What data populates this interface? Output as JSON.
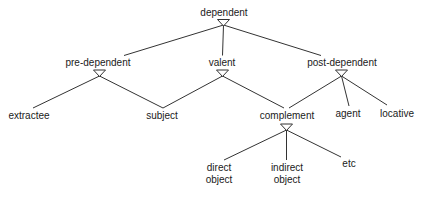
{
  "diagram": {
    "type": "tree",
    "style": {
      "background": "#ffffff",
      "line_color": "#333333",
      "text_color": "#1a1a1a",
      "marker": "hollow-downward-triangle"
    },
    "nodes": {
      "dependent": {
        "label": "dependent",
        "x": 224,
        "y": 16
      },
      "pre_dependent": {
        "label": "pre-dependent",
        "x": 98,
        "y": 66
      },
      "valent": {
        "label": "valent",
        "x": 222,
        "y": 66
      },
      "post_dependent": {
        "label": "post-dependent",
        "x": 342,
        "y": 66
      },
      "extractee": {
        "label": "extractee",
        "x": 29,
        "y": 119
      },
      "subject": {
        "label": "subject",
        "x": 162,
        "y": 119
      },
      "complement": {
        "label": "complement",
        "x": 287,
        "y": 119
      },
      "agent": {
        "label": "agent",
        "x": 348,
        "y": 117
      },
      "locative": {
        "label": "locative",
        "x": 397,
        "y": 117
      },
      "direct_object": {
        "label_line1": "direct",
        "label_line2": "object",
        "x": 219,
        "y": 171
      },
      "indirect_object": {
        "label_line1": "indirect",
        "label_line2": "object",
        "x": 287,
        "y": 171
      },
      "etc": {
        "label": "etc",
        "x": 349,
        "y": 167
      }
    },
    "edges": [
      {
        "from": "dependent",
        "to": "pre-dependent"
      },
      {
        "from": "dependent",
        "to": "valent"
      },
      {
        "from": "dependent",
        "to": "post-dependent"
      },
      {
        "from": "pre-dependent",
        "to": "extractee"
      },
      {
        "from": "pre-dependent",
        "to": "subject"
      },
      {
        "from": "valent",
        "to": "subject"
      },
      {
        "from": "valent",
        "to": "complement"
      },
      {
        "from": "post-dependent",
        "to": "complement"
      },
      {
        "from": "post-dependent",
        "to": "agent"
      },
      {
        "from": "post-dependent",
        "to": "locative"
      },
      {
        "from": "complement",
        "to": "direct object"
      },
      {
        "from": "complement",
        "to": "indirect object"
      },
      {
        "from": "complement",
        "to": "etc"
      }
    ]
  }
}
